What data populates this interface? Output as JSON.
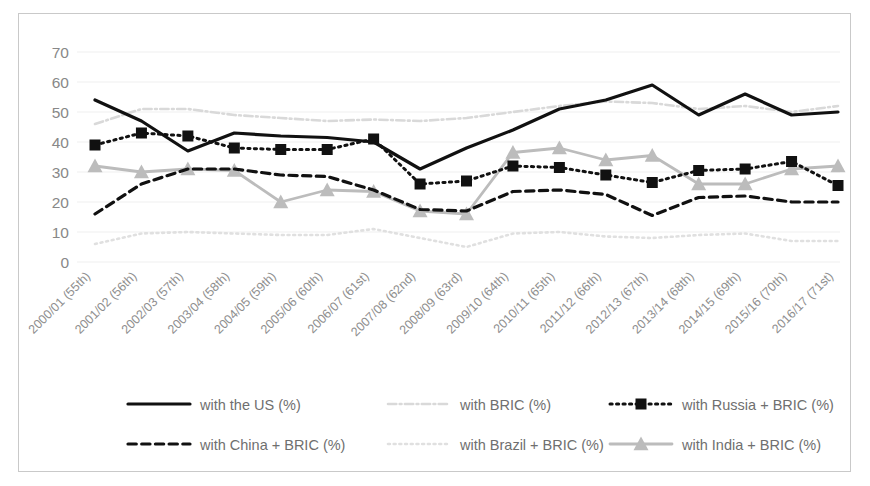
{
  "chart_data": {
    "type": "line",
    "title": "",
    "xlabel": "",
    "ylabel": "",
    "ylim": [
      0,
      70
    ],
    "ytick_step": 10,
    "yticks": [
      0,
      10,
      20,
      30,
      40,
      50,
      60,
      70
    ],
    "grid": true,
    "legend_position": "bottom",
    "categories": [
      "2000/01 (55th)",
      "2001/02 (56th)",
      "2002/03 (57th)",
      "2003/04 (58th)",
      "2004/05 (59th)",
      "2005/06 (60th)",
      "2006/07 (61st)",
      "2007/08 (62nd)",
      "2008/09 (63rd)",
      "2009/10 (64th)",
      "2010/11 (65th)",
      "2011/12 (66th)",
      "2012/13 (67th)",
      "2013/14 (68th)",
      "2014/15 (69th)",
      "2015/16 (70th)",
      "2016/17 (71st)"
    ],
    "series": [
      {
        "name": "with the US (%)",
        "color": "#111111",
        "style": "solid",
        "marker": "none",
        "width": 3.2,
        "values": [
          54,
          47,
          37,
          43,
          42,
          41.5,
          40,
          31,
          38,
          44,
          51,
          54,
          59,
          49,
          56,
          49,
          50
        ]
      },
      {
        "name": "with BRIC (%)",
        "color": "#d9d9d9",
        "style": "dashdot",
        "marker": "none",
        "width": 2.6,
        "values": [
          46,
          51,
          51,
          49,
          48,
          47,
          47.5,
          47,
          48,
          50,
          52,
          53.5,
          53,
          51,
          52,
          50,
          52
        ]
      },
      {
        "name": "with Russia + BRIC (%)",
        "color": "#111111",
        "style": "dotted",
        "marker": "square",
        "width": 3.0,
        "values": [
          39,
          43,
          42,
          38,
          37.5,
          37.5,
          41,
          26,
          27,
          32,
          31.5,
          29,
          26.5,
          30.5,
          31,
          33.5,
          25.5
        ]
      },
      {
        "name": "with China + BRIC (%)",
        "color": "#111111",
        "style": "dashed",
        "marker": "none",
        "width": 3.2,
        "values": [
          16,
          26,
          31,
          31,
          29,
          28.5,
          24,
          17.5,
          17,
          23.5,
          24,
          22.5,
          15.5,
          21.5,
          22,
          20,
          20
        ]
      },
      {
        "name": "with Brazil + BRIC (%)",
        "color": "#e0e0e0",
        "style": "dotted",
        "marker": "none",
        "width": 2.6,
        "values": [
          6,
          9.5,
          10,
          9.5,
          9,
          9,
          11,
          8,
          5,
          9.5,
          10,
          8.5,
          8,
          9,
          9.5,
          7,
          7
        ]
      },
      {
        "name": "with India + BRIC (%)",
        "color": "#bcbcbc",
        "style": "solid",
        "marker": "triangle",
        "width": 2.8,
        "values": [
          32,
          30,
          31,
          30.5,
          20,
          24,
          23.5,
          17,
          16,
          36.5,
          38,
          34,
          35.5,
          26,
          26,
          31,
          32
        ]
      }
    ]
  },
  "legend": {
    "entries": [
      {
        "label": "with the US (%)"
      },
      {
        "label": "with BRIC (%)"
      },
      {
        "label": "with Russia + BRIC (%)"
      },
      {
        "label": "with China + BRIC (%)"
      },
      {
        "label": "with Brazil + BRIC (%)"
      },
      {
        "label": "with India + BRIC (%)"
      }
    ]
  }
}
